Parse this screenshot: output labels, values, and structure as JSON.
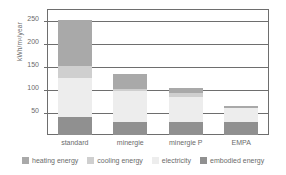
{
  "chart_data": {
    "type": "bar",
    "stacked": true,
    "title": "",
    "xlabel": "",
    "ylabel": "kWh/m2/year",
    "ylabel_display": "kWh/m²/year",
    "ylim": [
      0,
      275
    ],
    "yticks": [
      50,
      100,
      150,
      200,
      250
    ],
    "ytick_labels": [
      "50",
      "100",
      "150",
      "200",
      "250"
    ],
    "grid": true,
    "grid_axis": "y",
    "legend_position": "bottom",
    "categories": [
      "standard",
      "minergie",
      "minergie P",
      "EMPA"
    ],
    "series": [
      {
        "name": "embodied energy",
        "color": "#909090",
        "values": [
          40,
          28,
          29,
          28
        ]
      },
      {
        "name": "electricity",
        "color": "#ededed",
        "values": [
          85,
          68,
          55,
          30
        ]
      },
      {
        "name": "cooling energy",
        "color": "#cfcfcf",
        "values": [
          25,
          5,
          7,
          0
        ]
      },
      {
        "name": "heating energy",
        "color": "#a9a9a9",
        "values": [
          101,
          32,
          12,
          5
        ]
      }
    ],
    "totals": [
      251,
      133,
      103,
      63
    ],
    "legend": [
      {
        "label": "heating energy",
        "color": "#a9a9a9"
      },
      {
        "label": "cooling energy",
        "color": "#cfcfcf"
      },
      {
        "label": "electricity",
        "color": "#ededed"
      },
      {
        "label": "embodied energy",
        "color": "#909090"
      }
    ]
  }
}
